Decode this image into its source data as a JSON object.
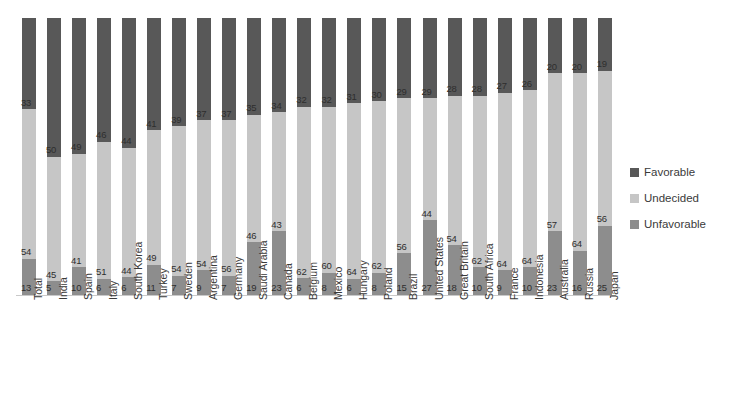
{
  "chart_data": {
    "type": "bar",
    "subtype": "stacked-bar-100",
    "title": "",
    "xlabel": "",
    "ylabel": "",
    "ylim": [
      0,
      100
    ],
    "grid": false,
    "legend_position": "right",
    "categories": [
      "Total",
      "India",
      "Spain",
      "Italy",
      "South Korea",
      "Turkey",
      "Sweden",
      "Argentina",
      "Germany",
      "Saudi Arabia",
      "Canada",
      "Belgium",
      "Mexico",
      "Hungary",
      "Poland",
      "Brazil",
      "United States",
      "Great Britain",
      "South Africa",
      "France",
      "Indonesia",
      "Australia",
      "Russia",
      "Japan"
    ],
    "series": [
      {
        "name": "Favorable",
        "color": "#585858",
        "values": [
          33,
          50,
          49,
          46,
          44,
          41,
          39,
          37,
          37,
          35,
          34,
          32,
          32,
          31,
          30,
          29,
          29,
          28,
          28,
          27,
          26,
          20,
          20,
          19
        ]
      },
      {
        "name": "Undecided",
        "color": "#c6c6c6",
        "values": [
          54,
          45,
          41,
          51,
          44,
          49,
          54,
          54,
          56,
          46,
          43,
          62,
          60,
          64,
          62,
          56,
          44,
          54,
          62,
          64,
          64,
          57,
          64,
          56
        ]
      },
      {
        "name": "Unfavorable",
        "color": "#8d8d8d",
        "values": [
          13,
          5,
          10,
          6,
          6,
          11,
          7,
          9,
          7,
          19,
          23,
          6,
          8,
          6,
          8,
          15,
          27,
          18,
          10,
          9,
          10,
          23,
          16,
          25
        ]
      }
    ]
  },
  "legend": {
    "items": [
      {
        "label": "Favorable",
        "color": "#585858",
        "swatch_class": "sw-fav"
      },
      {
        "label": "Undecided",
        "color": "#c6c6c6",
        "swatch_class": "sw-und"
      },
      {
        "label": "Unfavorable",
        "color": "#8d8d8d",
        "swatch_class": "sw-unf"
      }
    ]
  }
}
